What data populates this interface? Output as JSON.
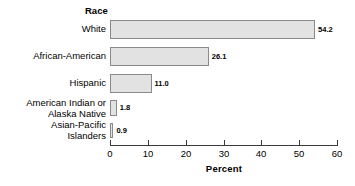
{
  "chart_data": {
    "type": "bar",
    "orientation": "horizontal",
    "title": "",
    "category_axis_title": "Race",
    "xlabel": "Percent",
    "ylabel": "Race",
    "categories": [
      "White",
      "African-American",
      "Hispanic",
      "American Indian or Alaska Native",
      "Asian-Pacific Islanders"
    ],
    "category_lines": [
      [
        "White"
      ],
      [
        "African-American"
      ],
      [
        "Hispanic"
      ],
      [
        "American Indian or",
        "Alaska Native"
      ],
      [
        "Asian-Pacific",
        "Islanders"
      ]
    ],
    "values": [
      54.2,
      26.1,
      11.0,
      1.8,
      0.9
    ],
    "value_labels": [
      "54.2",
      "26.1",
      "11.0",
      "1.8",
      "0.9"
    ],
    "xlim": [
      0,
      60
    ],
    "xticks": [
      0,
      10,
      20,
      30,
      40,
      50,
      60
    ],
    "xtick_labels": [
      "0",
      "10",
      "20",
      "30",
      "40",
      "50",
      "60"
    ],
    "grid": false,
    "legend": false,
    "bar_fill_color": "#e2e2e2",
    "bar_edge_color": "#8a8a8a",
    "axis_color": "#3a3a3a",
    "background_color": "#ffffff"
  }
}
